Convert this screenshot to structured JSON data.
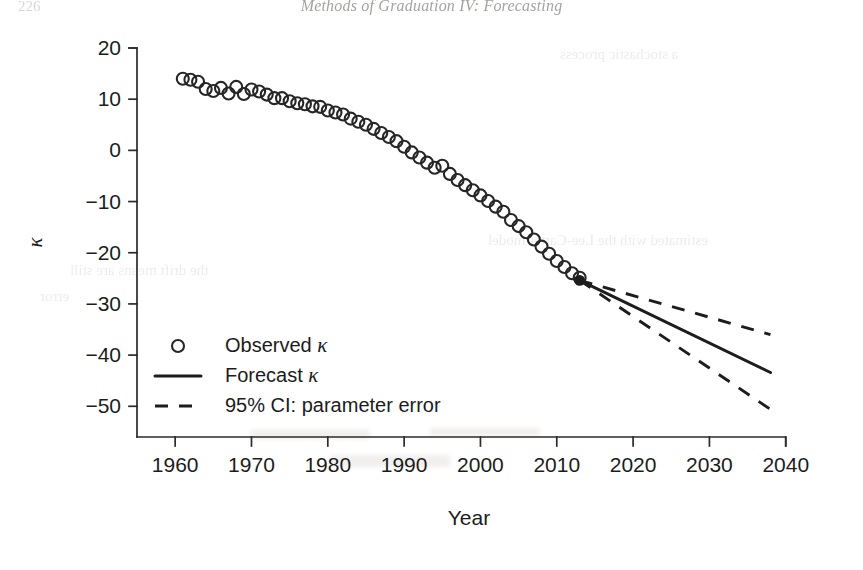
{
  "page": {
    "folio": "226",
    "running_head": "Methods of Graduation IV: Forecasting",
    "bleed_text": {
      "line1": "a stochastic process",
      "line2": "estimated with the Lee-Carter model",
      "line3": "the drift means are still",
      "line4": "error"
    }
  },
  "chart_data": {
    "type": "line",
    "title": "",
    "xlabel": "Year",
    "ylabel": "κ",
    "xlim": [
      1955,
      2042
    ],
    "ylim": [
      -56,
      20
    ],
    "xticks": [
      1960,
      1970,
      1980,
      1990,
      2000,
      2010,
      2020,
      2030,
      2040
    ],
    "xticklabels": [
      "1960",
      "1970",
      "1980",
      "1990",
      "2000",
      "2010",
      "2020",
      "2030",
      "2040"
    ],
    "yticks": [
      20,
      10,
      0,
      -10,
      -20,
      -30,
      -40,
      -50
    ],
    "yticklabels": [
      "20",
      "10",
      "0",
      "−10",
      "−20",
      "−30",
      "−40",
      "−50"
    ],
    "grid": false,
    "legend_position": "lower left",
    "legend": [
      {
        "key": "observed",
        "label": "Observed κ",
        "marker": "open-circle",
        "linestyle": "none"
      },
      {
        "key": "forecast",
        "label": "Forecast κ",
        "marker": "none",
        "linestyle": "solid"
      },
      {
        "key": "ci",
        "label": "95% CI: parameter error",
        "marker": "none",
        "linestyle": "dashed"
      }
    ],
    "series": [
      {
        "name": "Observed κ",
        "type": "scatter",
        "marker": "open-circle",
        "x": [
          1961,
          1962,
          1963,
          1964,
          1965,
          1966,
          1967,
          1968,
          1969,
          1970,
          1971,
          1972,
          1973,
          1974,
          1975,
          1976,
          1977,
          1978,
          1979,
          1980,
          1981,
          1982,
          1983,
          1984,
          1985,
          1986,
          1987,
          1988,
          1989,
          1990,
          1991,
          1992,
          1993,
          1994,
          1995,
          1996,
          1997,
          1998,
          1999,
          2000,
          2001,
          2002,
          2003,
          2004,
          2005,
          2006,
          2007,
          2008,
          2009,
          2010,
          2011,
          2012,
          2013
        ],
        "y": [
          14.0,
          13.8,
          13.4,
          12.0,
          11.6,
          12.2,
          11.1,
          12.4,
          11.0,
          11.9,
          11.5,
          10.9,
          10.2,
          10.2,
          9.6,
          9.2,
          9.0,
          8.6,
          8.5,
          7.8,
          7.4,
          7.0,
          6.2,
          5.6,
          5.0,
          4.2,
          3.4,
          2.6,
          1.8,
          0.7,
          -0.4,
          -1.4,
          -2.4,
          -3.4,
          -3.0,
          -4.6,
          -5.8,
          -6.8,
          -7.8,
          -8.8,
          -9.9,
          -11.0,
          -12.0,
          -13.6,
          -14.8,
          -16.0,
          -17.4,
          -18.8,
          -20.2,
          -21.6,
          -22.8,
          -24.0,
          -24.9
        ]
      },
      {
        "name": "Forecast κ",
        "type": "line",
        "linestyle": "solid",
        "x": [
          2013,
          2038
        ],
        "y": [
          -25.4,
          -43.4
        ]
      },
      {
        "name": "95% CI upper: parameter error",
        "type": "line",
        "linestyle": "dashed",
        "x": [
          2013,
          2038
        ],
        "y": [
          -25.4,
          -36.0
        ]
      },
      {
        "name": "95% CI lower: parameter error",
        "type": "line",
        "linestyle": "dashed",
        "x": [
          2013,
          2038
        ],
        "y": [
          -25.4,
          -50.6
        ]
      }
    ]
  }
}
